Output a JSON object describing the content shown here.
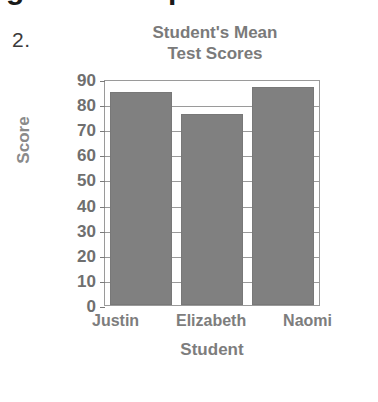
{
  "item_number": "2.",
  "top_bleed": {
    "glyph_left": "g",
    "glyph_right": "p"
  },
  "chart_data": {
    "type": "bar",
    "title": "Student's Mean Test Scores",
    "title_lines": [
      "Student's Mean",
      "Test Scores"
    ],
    "categories": [
      "Justin",
      "Elizabeth",
      "Naomi"
    ],
    "values": [
      85,
      76,
      87
    ],
    "xlabel": "Student",
    "ylabel": "Score",
    "ylim": [
      0,
      90
    ],
    "ytick_step": 10,
    "yticks": [
      "90",
      "80",
      "70",
      "60",
      "50",
      "40",
      "30",
      "20",
      "10",
      "0"
    ],
    "grid": true,
    "legend": false,
    "bar_color": "#808080",
    "axis_color": "#9a9a9a",
    "text_color": "#7d7d7d"
  }
}
